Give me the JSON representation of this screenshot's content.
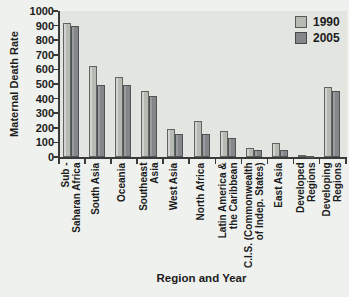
{
  "chart_data": {
    "type": "bar",
    "title": "",
    "xlabel": "Region and Year",
    "ylabel": "Maternal Death Rate",
    "ylim": [
      0,
      1000
    ],
    "ytick_step": 100,
    "grid": false,
    "legend_position": "top-right",
    "categories": [
      "Sub -\nSaharan Africa",
      "South Asia",
      "Oceania",
      "Southeast\nAsia",
      "West Asia",
      "North Africa",
      "Latin America &\nthe Caribbean",
      "C.I.S. (Commonwealth\nof Indep. States)",
      "East Asia",
      "Developed\nRegions",
      "Developing\nRegions"
    ],
    "series": [
      {
        "name": "1990",
        "values": [
          920,
          620,
          550,
          450,
          190,
          250,
          180,
          60,
          95,
          11,
          480
        ]
      },
      {
        "name": "2005",
        "values": [
          900,
          490,
          490,
          420,
          160,
          160,
          130,
          50,
          50,
          9,
          450
        ]
      }
    ]
  },
  "colors": {
    "series_1990_fill": "#b7b9b3",
    "series_2005_fill": "#84878a",
    "plot_background": "#e3e5e1",
    "page_background": "#eff1ee",
    "axis": "#3a3a3a",
    "text": "#1c1c1c"
  }
}
